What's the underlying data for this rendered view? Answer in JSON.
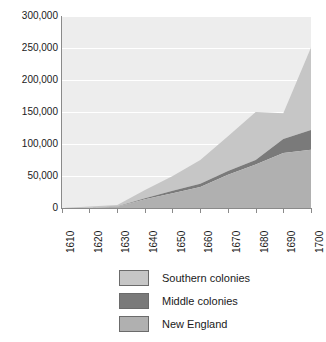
{
  "chart_data": {
    "type": "area",
    "stacked": true,
    "title": "",
    "subtitle": "",
    "xlabel": "",
    "ylabel": "",
    "x": [
      1610,
      1620,
      1630,
      1640,
      1650,
      1660,
      1670,
      1680,
      1690,
      1700
    ],
    "categories": [
      "1610",
      "1620",
      "1630",
      "1640",
      "1650",
      "1660",
      "1670",
      "1680",
      "1690",
      "1700"
    ],
    "series": [
      {
        "name": "New England",
        "color": "#b0b0b0",
        "values": [
          0,
          500,
          1800,
          13700,
          23000,
          33000,
          52000,
          68000,
          86000,
          91000
        ]
      },
      {
        "name": "Middle colonies",
        "color": "#7a7a7a",
        "values": [
          0,
          0,
          500,
          1500,
          4000,
          5000,
          6000,
          7000,
          22000,
          31000
        ]
      },
      {
        "name": "Southern colonies",
        "color": "#c6c6c6",
        "values": [
          200,
          2000,
          2500,
          13000,
          23000,
          37000,
          54000,
          75000,
          40000,
          129000
        ]
      }
    ],
    "cumulative_totals": [
      200,
      2500,
      4800,
      28200,
      50000,
      75000,
      112000,
      150000,
      148000,
      251000
    ],
    "ylim": [
      0,
      300000
    ],
    "xlim": [
      1610,
      1700
    ],
    "yticks": [
      0,
      50000,
      100000,
      150000,
      200000,
      250000,
      300000
    ],
    "ytick_labels": [
      "0",
      "50,000",
      "100,000",
      "150,000",
      "200,000",
      "250,000",
      "300,000"
    ],
    "grid": true,
    "grid_color": "#ffffff",
    "plot_background": "#ededed",
    "legend_position": "bottom",
    "legend_order": [
      "Southern colonies",
      "Middle colonies",
      "New England"
    ]
  },
  "axes": {
    "y_tick_labels": [
      "300,000",
      "250,000",
      "200,000",
      "150,000",
      "100,000",
      "50,000",
      "0"
    ],
    "x_tick_labels": [
      "1610",
      "1620",
      "1630",
      "1640",
      "1650",
      "1660",
      "1670",
      "1680",
      "1690",
      "1700"
    ]
  },
  "legend": {
    "items": [
      {
        "label": "Southern colonies",
        "color": "#c6c6c6"
      },
      {
        "label": "Middle colonies",
        "color": "#7a7a7a"
      },
      {
        "label": "New England",
        "color": "#b0b0b0"
      }
    ]
  }
}
